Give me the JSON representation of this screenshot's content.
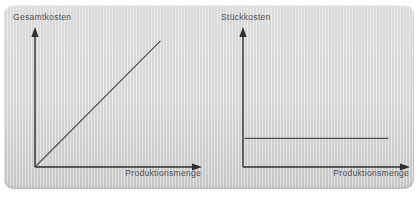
{
  "figure": {
    "background_color": "#ffffff",
    "panel_color": "#dddddd",
    "text_color": "#4f4f4f",
    "axis_color": "#2e2e2e"
  },
  "chart_data": [
    {
      "type": "line",
      "title": "",
      "ylabel": "Gesamtkosten",
      "xlabel": "Produktionsmenge",
      "axes": "schematic axes with solid arrowheads, no ticks, no numeric scale, no grid",
      "legend": "none",
      "xlim": [
        0,
        1
      ],
      "ylim": [
        0,
        1
      ],
      "series": [
        {
          "name": "Gesamtkosten (linear ansteigend)",
          "color": "#4c4c4c",
          "x": [
            0,
            0.82
          ],
          "y": [
            0,
            0.97
          ]
        }
      ],
      "description": "Total costs rise proportionally with production quantity: straight line from the origin."
    },
    {
      "type": "line",
      "title": "",
      "ylabel": "Stückkosten",
      "xlabel": "Produktionsmenge",
      "axes": "schematic axes with solid arrowheads, no ticks, no numeric scale, no grid",
      "legend": "none",
      "xlim": [
        0,
        1
      ],
      "ylim": [
        0,
        1
      ],
      "series": [
        {
          "name": "Stückkosten (konstant)",
          "color": "#4c4c4c",
          "x": [
            0.01,
            0.95
          ],
          "y": [
            0.22,
            0.22
          ]
        }
      ],
      "description": "Unit costs stay constant over production quantity: horizontal line."
    }
  ]
}
